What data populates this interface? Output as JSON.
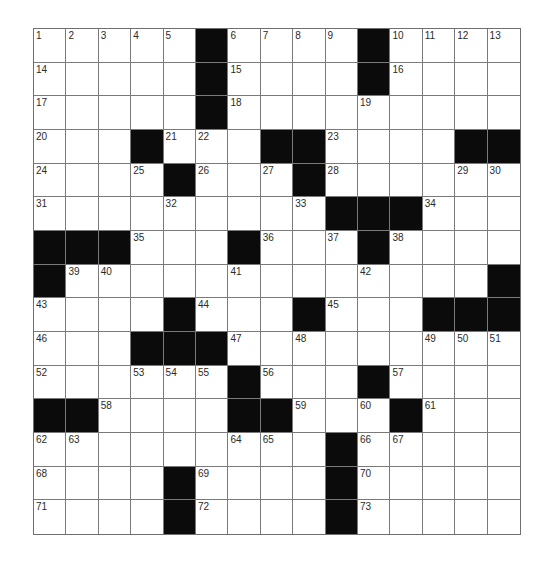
{
  "puzzle": {
    "rows": 15,
    "cols": 15,
    "colors": {
      "block": "#0b0b0b",
      "cell": "#ffffff",
      "gridline": "#7a7a7a",
      "number": "#2a2a2a"
    },
    "layout": [
      "#####.#####.####",
      "x"
    ],
    "grid": [
      [
        {
          "n": "1"
        },
        {
          "n": "2"
        },
        {
          "n": "3"
        },
        {
          "n": "4"
        },
        {
          "n": "5"
        },
        {
          "b": true
        },
        {
          "n": "6"
        },
        {
          "n": "7"
        },
        {
          "n": "8"
        },
        {
          "n": "9"
        },
        {
          "b": true
        },
        {
          "n": "10"
        },
        {
          "n": "11"
        },
        {
          "n": "12"
        },
        {
          "n": "13"
        }
      ],
      [
        {
          "n": "14"
        },
        {},
        {},
        {},
        {},
        {
          "b": true
        },
        {
          "n": "15"
        },
        {},
        {},
        {},
        {
          "b": true
        },
        {
          "n": "16"
        },
        {},
        {},
        {}
      ],
      [
        {
          "n": "17"
        },
        {},
        {},
        {},
        {},
        {
          "b": true
        },
        {
          "n": "18"
        },
        {},
        {},
        {},
        {
          "n": "19"
        },
        {},
        {},
        {},
        {}
      ],
      [
        {
          "n": "20"
        },
        {},
        {},
        {
          "b": true
        },
        {
          "n": "21"
        },
        {
          "n": "22"
        },
        {},
        {
          "b": true
        },
        {
          "b": true
        },
        {
          "n": "23"
        },
        {},
        {},
        {},
        {
          "b": true
        },
        {
          "b": true
        }
      ],
      [
        {
          "n": "24"
        },
        {},
        {},
        {
          "n": "25"
        },
        {
          "b": true
        },
        {
          "n": "26"
        },
        {},
        {
          "n": "27"
        },
        {
          "b": true
        },
        {
          "n": "28"
        },
        {},
        {},
        {},
        {
          "n": "29"
        },
        {
          "n": "30"
        }
      ],
      [
        {
          "n": "31"
        },
        {},
        {},
        {},
        {
          "n": "32"
        },
        {},
        {},
        {},
        {
          "n": "33"
        },
        {
          "b": true
        },
        {
          "b": true
        },
        {
          "b": true
        },
        {
          "n": "34"
        },
        {},
        {}
      ],
      [
        {
          "b": true
        },
        {
          "b": true
        },
        {
          "b": true
        },
        {
          "n": "35"
        },
        {},
        {},
        {
          "b": true
        },
        {
          "n": "36"
        },
        {},
        {
          "n": "37"
        },
        {
          "b": true
        },
        {
          "n": "38"
        },
        {},
        {},
        {}
      ],
      [
        {
          "b": true
        },
        {
          "n": "39"
        },
        {
          "n": "40"
        },
        {},
        {},
        {},
        {
          "n": "41"
        },
        {},
        {},
        {},
        {
          "n": "42"
        },
        {},
        {},
        {},
        {
          "b": true
        }
      ],
      [
        {
          "n": "43"
        },
        {},
        {},
        {},
        {
          "b": true
        },
        {
          "n": "44"
        },
        {},
        {},
        {
          "b": true
        },
        {
          "n": "45"
        },
        {},
        {},
        {
          "b": true
        },
        {
          "b": true
        },
        {
          "b": true
        }
      ],
      [
        {
          "n": "46"
        },
        {},
        {},
        {
          "b": true
        },
        {
          "b": true
        },
        {
          "b": true
        },
        {
          "n": "47"
        },
        {},
        {
          "n": "48"
        },
        {},
        {},
        {},
        {
          "n": "49"
        },
        {
          "n": "50"
        },
        {
          "n": "51"
        }
      ],
      [
        {
          "n": "52"
        },
        {},
        {},
        {
          "n": "53"
        },
        {
          "n": "54"
        },
        {
          "n": "55"
        },
        {
          "b": true
        },
        {
          "n": "56"
        },
        {},
        {},
        {
          "b": true
        },
        {
          "n": "57"
        },
        {},
        {},
        {}
      ],
      [
        {
          "b": true
        },
        {
          "b": true
        },
        {
          "n": "58"
        },
        {},
        {},
        {},
        {
          "b": true
        },
        {
          "b": true
        },
        {
          "n": "59"
        },
        {},
        {
          "n": "60"
        },
        {
          "b": true
        },
        {
          "n": "61"
        },
        {},
        {}
      ],
      [
        {
          "n": "62"
        },
        {
          "n": "63"
        },
        {},
        {},
        {},
        {},
        {
          "n": "64"
        },
        {
          "n": "65"
        },
        {},
        {
          "b": true
        },
        {
          "n": "66"
        },
        {
          "n": "67"
        },
        {},
        {},
        {}
      ],
      [
        {
          "n": "68"
        },
        {},
        {},
        {},
        {
          "b": true
        },
        {
          "n": "69"
        },
        {},
        {},
        {},
        {
          "b": true
        },
        {
          "n": "70"
        },
        {},
        {},
        {},
        {}
      ],
      [
        {
          "n": "71"
        },
        {},
        {},
        {},
        {
          "b": true
        },
        {
          "n": "72"
        },
        {},
        {},
        {},
        {
          "b": true
        },
        {
          "n": "73"
        },
        {},
        {},
        {},
        {}
      ]
    ]
  }
}
